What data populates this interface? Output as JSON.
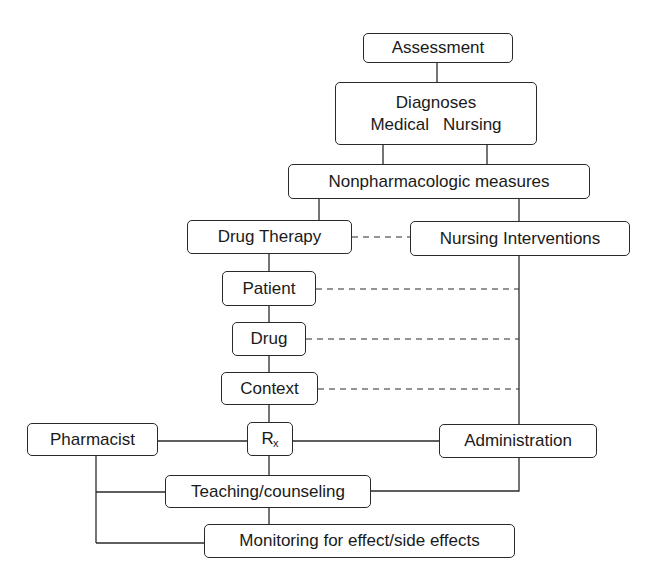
{
  "diagram": {
    "type": "flowchart",
    "nodes": {
      "assessment": "Assessment",
      "diagnoses": {
        "title": "Diagnoses",
        "medical": "Medical",
        "nursing": "Nursing"
      },
      "nonpharm": "Nonpharmacologic measures",
      "drug_therapy": "Drug Therapy",
      "nursing_interventions": "Nursing Interventions",
      "patient": "Patient",
      "drug": "Drug",
      "context": "Context",
      "rx": {
        "main": "R",
        "sub": "x"
      },
      "pharmacist": "Pharmacist",
      "administration": "Administration",
      "teaching": "Teaching/counseling",
      "monitoring": "Monitoring for effect/side effects"
    },
    "edges": [
      {
        "from": "Assessment",
        "to": "Diagnoses",
        "style": "solid"
      },
      {
        "from": "Diagnoses (Medical)",
        "to": "Nonpharmacologic measures",
        "style": "solid"
      },
      {
        "from": "Diagnoses (Nursing)",
        "to": "Nonpharmacologic measures",
        "style": "solid"
      },
      {
        "from": "Nonpharmacologic measures",
        "to": "Drug Therapy",
        "style": "solid"
      },
      {
        "from": "Nonpharmacologic measures",
        "to": "Nursing Interventions",
        "style": "solid"
      },
      {
        "from": "Drug Therapy",
        "to": "Nursing Interventions",
        "style": "dashed"
      },
      {
        "from": "Drug Therapy",
        "to": "Patient",
        "style": "solid"
      },
      {
        "from": "Patient",
        "to": "Drug",
        "style": "solid"
      },
      {
        "from": "Drug",
        "to": "Context",
        "style": "solid"
      },
      {
        "from": "Context",
        "to": "Rx",
        "style": "solid"
      },
      {
        "from": "Patient",
        "to": "Nursing Interventions line",
        "style": "dashed"
      },
      {
        "from": "Drug",
        "to": "Nursing Interventions line",
        "style": "dashed"
      },
      {
        "from": "Context",
        "to": "Nursing Interventions line",
        "style": "dashed"
      },
      {
        "from": "Nursing Interventions",
        "to": "Administration",
        "style": "solid"
      },
      {
        "from": "Pharmacist",
        "to": "Rx",
        "style": "solid"
      },
      {
        "from": "Rx",
        "to": "Administration",
        "style": "solid"
      },
      {
        "from": "Rx",
        "to": "Teaching/counseling",
        "style": "solid"
      },
      {
        "from": "Pharmacist",
        "to": "Teaching/counseling",
        "style": "solid"
      },
      {
        "from": "Administration",
        "to": "Teaching/counseling",
        "style": "solid"
      },
      {
        "from": "Teaching/counseling",
        "to": "Monitoring for effect/side effects",
        "style": "solid"
      },
      {
        "from": "Pharmacist",
        "to": "Monitoring for effect/side effects",
        "style": "solid"
      }
    ]
  }
}
